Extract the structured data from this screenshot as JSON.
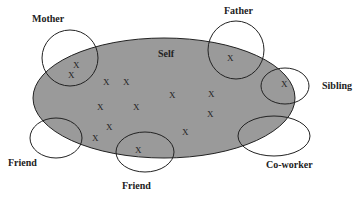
{
  "diagram": {
    "colors": {
      "self_fill": "#9a9a9a",
      "stroke": "#222222",
      "background": "#ffffff"
    },
    "self": {
      "label": "Self",
      "cx": 164,
      "cy": 98,
      "rx": 131,
      "ry": 60,
      "label_x": 158,
      "label_y": 57
    },
    "others": [
      {
        "id": "mother",
        "label": "Mother",
        "cx": 70,
        "cy": 58,
        "rx": 28,
        "ry": 28,
        "label_x": 32,
        "label_y": 22
      },
      {
        "id": "father",
        "label": "Father",
        "cx": 236,
        "cy": 50,
        "rx": 28,
        "ry": 29,
        "label_x": 224,
        "label_y": 14
      },
      {
        "id": "sibling",
        "label": "Sibling",
        "cx": 285,
        "cy": 86,
        "rx": 24,
        "ry": 18,
        "label_x": 322,
        "label_y": 89
      },
      {
        "id": "friend-left",
        "label": "Friend",
        "cx": 56,
        "cy": 138,
        "rx": 26,
        "ry": 20,
        "label_x": 8,
        "label_y": 166
      },
      {
        "id": "friend-bottom",
        "label": "Friend",
        "cx": 145,
        "cy": 152,
        "rx": 29,
        "ry": 20,
        "label_x": 122,
        "label_y": 189
      },
      {
        "id": "co-worker",
        "label": "Co-worker",
        "cx": 274,
        "cy": 136,
        "rx": 36,
        "ry": 20,
        "label_x": 266,
        "label_y": 168
      }
    ],
    "marker": "X",
    "x_marks": [
      [
        76,
        68
      ],
      [
        71,
        78
      ],
      [
        230,
        61
      ],
      [
        284,
        87
      ],
      [
        106,
        85
      ],
      [
        126,
        85
      ],
      [
        172,
        98
      ],
      [
        211,
        97
      ],
      [
        100,
        110
      ],
      [
        136,
        110
      ],
      [
        210,
        117
      ],
      [
        109,
        130
      ],
      [
        185,
        135
      ],
      [
        95,
        141
      ],
      [
        138,
        153
      ]
    ]
  }
}
